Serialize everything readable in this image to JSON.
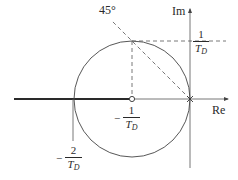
{
  "diagram": {
    "type": "root-locus",
    "axes": {
      "real_label": "Re",
      "imag_label": "Im"
    },
    "angle_label": "45°",
    "labels": {
      "center": {
        "sign": "−",
        "numerator": "1",
        "denominator_var": "T",
        "denominator_sub": "D"
      },
      "left_crossing": {
        "sign": "−",
        "numerator": "2",
        "denominator_var": "T",
        "denominator_sub": "D"
      },
      "imag_top": {
        "sign": "",
        "numerator": "1",
        "denominator_var": "T",
        "denominator_sub": "D"
      }
    },
    "elements": {
      "circle": {
        "center_label": "-1/T_D",
        "radius_label": "1/T_D"
      },
      "zero_marker": "open circle at -1/T_D",
      "pole_marker": "cross at origin",
      "locus_line": "real axis from -infinity to -1/T_D"
    },
    "colors": {
      "stroke": "#3a3a3a",
      "axis": "#555555",
      "dashed": "#555555",
      "locus": "#2a2a2a"
    }
  }
}
